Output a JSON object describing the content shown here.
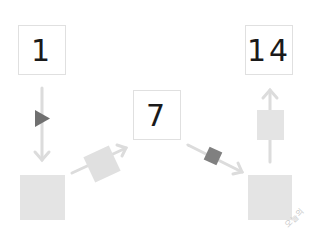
{
  "diagram": {
    "boxes": [
      {
        "id": "box-a",
        "label": "1"
      },
      {
        "id": "box-b",
        "label": "7"
      },
      {
        "id": "box-c",
        "label": "14"
      }
    ],
    "squares": [
      {
        "id": "square-bottom-left",
        "color": "#e4e4e4"
      },
      {
        "id": "square-bottom-right",
        "color": "#e4e4e4"
      }
    ],
    "markers": [
      {
        "id": "marker-triangle",
        "shape": "triangle-right",
        "color": "#707070"
      },
      {
        "id": "marker-tilted-light",
        "shape": "tilted-square",
        "color": "#e0e0e0"
      },
      {
        "id": "marker-tilted-dark",
        "shape": "tilted-square",
        "color": "#808080"
      },
      {
        "id": "marker-upright-light",
        "shape": "square",
        "color": "#e4e4e4"
      }
    ],
    "arrows": [
      {
        "from": "box-a",
        "to": "square-bottom-left"
      },
      {
        "from": "square-bottom-left",
        "to": "box-b"
      },
      {
        "from": "box-b",
        "to": "square-bottom-right"
      },
      {
        "from": "square-bottom-right",
        "to": "box-c"
      }
    ],
    "arrow_color": "#dcdcdc",
    "watermark": "오늘의"
  }
}
